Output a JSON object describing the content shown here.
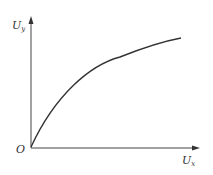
{
  "diagram": {
    "y_axis_label": "U",
    "y_axis_sub": "y",
    "x_axis_label": "U",
    "x_axis_sub": "x",
    "origin_label": "O",
    "curve": "concave increasing from origin, saturating",
    "line_color": "#333333"
  }
}
